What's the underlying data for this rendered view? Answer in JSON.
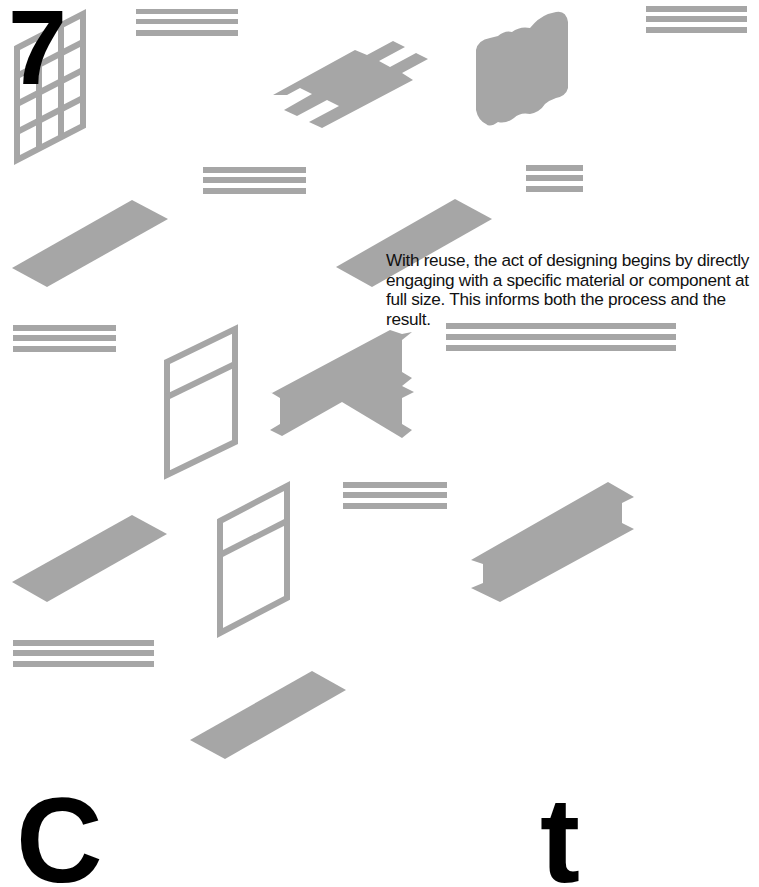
{
  "page": {
    "number": "7",
    "caption": "With reuse, the act of designing begins by directly engaging with a specific material or component at full size. This informs both the process and the result.",
    "bottom_heading_visible_glyphs": [
      "C",
      "t"
    ]
  },
  "colors": {
    "background": "#ffffff",
    "component_gray": "#a6a6a6",
    "text": "#111111",
    "heading": "#000000"
  },
  "illustrations": [
    {
      "name": "window-grid-frame",
      "label": "window frame with grid"
    },
    {
      "name": "stripe-group",
      "label": "stacked boards"
    },
    {
      "name": "plate-with-tabs",
      "label": "plate with tabs"
    },
    {
      "name": "corrugated-block",
      "label": "corrugated block"
    },
    {
      "name": "flat-plank",
      "label": "plank"
    },
    {
      "name": "t-beam",
      "label": "T-junction beam"
    },
    {
      "name": "window-frame",
      "label": "window frame"
    },
    {
      "name": "i-beam",
      "label": "I-beam"
    }
  ]
}
